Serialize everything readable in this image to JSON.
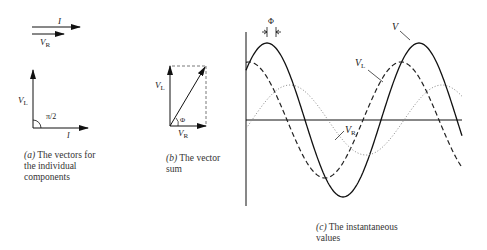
{
  "panels": {
    "a": {
      "caption_prefix": "(a)",
      "caption": "The vectors for the individual components",
      "labels": {
        "current": "I",
        "vr": "V",
        "vr_sub": "R",
        "vl": "V",
        "vl_sub": "L",
        "angle": "π/2",
        "current2": "I"
      }
    },
    "b": {
      "caption_prefix": "(b)",
      "caption": "The vector sum",
      "labels": {
        "vl": "V",
        "vl_sub": "L",
        "vr": "V",
        "vr_sub": "R",
        "phase": "Φ"
      }
    },
    "c": {
      "caption_prefix": "(c)",
      "caption": "The instantaneous values",
      "labels": {
        "v": "V",
        "vl": "V",
        "vl_sub": "L",
        "vr": "V",
        "vr_sub": "R",
        "phase": "Φ"
      }
    }
  },
  "waveforms": [
    {
      "name": "V",
      "style": "solid",
      "amplitude": 77,
      "phase_shift_px": 22
    },
    {
      "name": "V_L",
      "style": "dashed",
      "amplitude": 58,
      "phase_shift_px": 40
    },
    {
      "name": "V_R",
      "style": "dotted",
      "amplitude": 35,
      "phase_shift_px": 0
    }
  ]
}
